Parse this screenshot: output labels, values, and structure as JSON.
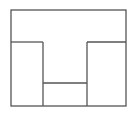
{
  "diagram": {
    "type": "floor-plan",
    "stroke_color": "#555555",
    "background": "#ffffff",
    "outer": {
      "x": 11,
      "y": 10,
      "width": 115,
      "height": 96
    },
    "lines": [
      {
        "name": "left-room-top-wall",
        "x1": 11,
        "y1": 42,
        "x2": 43,
        "y2": 42
      },
      {
        "name": "right-room-top-wall",
        "x1": 87,
        "y1": 42,
        "x2": 126,
        "y2": 42
      },
      {
        "name": "left-divider-wall",
        "x1": 43,
        "y1": 42,
        "x2": 43,
        "y2": 106
      },
      {
        "name": "right-divider-wall",
        "x1": 87,
        "y1": 42,
        "x2": 87,
        "y2": 106
      },
      {
        "name": "center-room-top-wall",
        "x1": 43,
        "y1": 83,
        "x2": 87,
        "y2": 83
      }
    ]
  }
}
